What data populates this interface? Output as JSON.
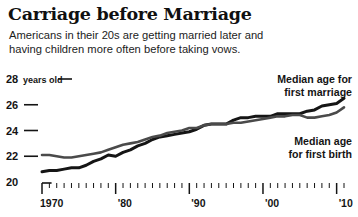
{
  "title": "Carriage before Marriage",
  "subtitle_lines": [
    "Americans in their 20s are getting married later and",
    "having children more often before taking vows."
  ],
  "axis": {
    "y_unit_label": "years old",
    "y_ticks": [
      "28",
      "26",
      "24",
      "22",
      "20"
    ],
    "x_ticks": [
      "1970",
      "'80",
      "'90",
      "'00",
      "'10"
    ]
  },
  "annotations": {
    "marriage": [
      "Median age for",
      "first marriage"
    ],
    "birth": [
      "Median age",
      "for first birth"
    ]
  },
  "colors": {
    "marriage_line": "#151515",
    "birth_line": "#4a4a4a",
    "text": "#141414",
    "background": "#ffffff"
  },
  "chart_data": {
    "type": "line",
    "title": "Carriage before Marriage",
    "subtitle": "Americans in their 20s are getting married later and having children more often before taking vows.",
    "xlabel": "",
    "ylabel": "years old",
    "xlim": [
      1970,
      2011
    ],
    "ylim": [
      20,
      28
    ],
    "grid": false,
    "legend": "annotated-inline",
    "x": [
      1970,
      1971,
      1972,
      1973,
      1974,
      1975,
      1976,
      1977,
      1978,
      1979,
      1980,
      1981,
      1982,
      1983,
      1984,
      1985,
      1986,
      1987,
      1988,
      1989,
      1990,
      1991,
      1992,
      1993,
      1994,
      1995,
      1996,
      1997,
      1998,
      1999,
      2000,
      2001,
      2002,
      2003,
      2004,
      2005,
      2006,
      2007,
      2008,
      2009,
      2010,
      2011
    ],
    "series": [
      {
        "name": "Median age for first marriage",
        "values": [
          20.8,
          20.9,
          20.9,
          21.0,
          21.1,
          21.1,
          21.3,
          21.6,
          21.8,
          22.1,
          22.0,
          22.3,
          22.5,
          22.8,
          23.0,
          23.3,
          23.5,
          23.6,
          23.7,
          23.8,
          23.9,
          24.1,
          24.4,
          24.5,
          24.5,
          24.5,
          24.8,
          25.0,
          25.0,
          25.1,
          25.1,
          25.1,
          25.3,
          25.3,
          25.3,
          25.3,
          25.5,
          25.6,
          25.9,
          26.0,
          26.1,
          26.5
        ]
      },
      {
        "name": "Median age for first birth",
        "values": [
          22.1,
          22.1,
          22.0,
          21.9,
          21.9,
          22.0,
          22.1,
          22.2,
          22.3,
          22.5,
          22.7,
          22.9,
          23.0,
          23.1,
          23.3,
          23.5,
          23.6,
          23.8,
          23.9,
          24.0,
          24.2,
          24.2,
          24.4,
          24.5,
          24.5,
          24.5,
          24.6,
          24.6,
          24.7,
          24.8,
          24.9,
          25.0,
          25.1,
          25.1,
          25.2,
          25.2,
          25.0,
          25.0,
          25.1,
          25.2,
          25.4,
          25.8
        ]
      }
    ]
  }
}
